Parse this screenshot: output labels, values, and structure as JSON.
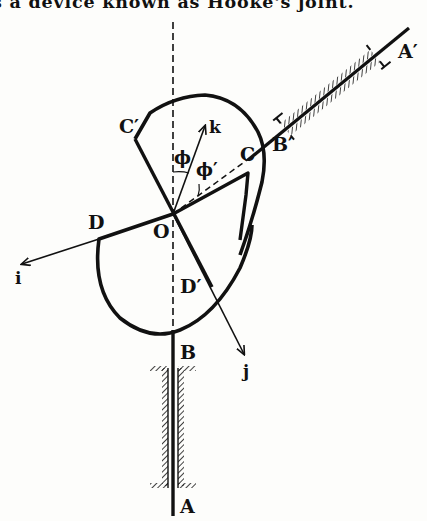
{
  "caption": "s a device known as Hooke's joint.",
  "figure": {
    "labels": {
      "A_prime": "A′",
      "B_prime": "B′",
      "C_prime": "C′",
      "C": "C",
      "k": "k",
      "phi": "ϕ",
      "phi_prime": "ϕ′",
      "D": "D",
      "O": "O",
      "i": "i",
      "D_prime": "D′",
      "j": "j",
      "B": "B",
      "A": "A"
    },
    "points": {
      "O": [
        173,
        214
      ],
      "C_prime": [
        135,
        139
      ],
      "C": [
        248,
        173
      ],
      "D": [
        99,
        239
      ],
      "D_prime": [
        212,
        287
      ],
      "B_prime": [
        263,
        148
      ],
      "A_prime_end": [
        407,
        30
      ],
      "B_lower": [
        173,
        333
      ],
      "A_lower": [
        173,
        515
      ],
      "i_tip": [
        22,
        264
      ],
      "j_tip": [
        244,
        356
      ],
      "k_tip": [
        205,
        128
      ]
    },
    "colors": {
      "ink": "#111111",
      "paper": "#fdfdfb"
    }
  }
}
